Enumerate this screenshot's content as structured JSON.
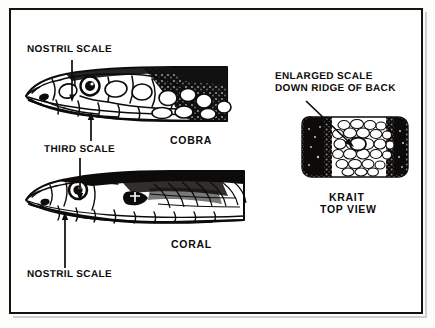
{
  "figure": {
    "type": "line-art-illustration",
    "background_color": "#ffffff",
    "ink_color": "#0d0b09",
    "frame_color": "#15120f"
  },
  "annotations": [
    {
      "id": "nostril-scale-cobra",
      "text": "NOSTRIL SCALE",
      "points_to": "cobra-nostril-scale",
      "leader": "vertical-line-down"
    },
    {
      "id": "third-scale",
      "text": "THIRD SCALE",
      "points_to": "cobra-third-scale-and-coral-third-scale",
      "leader": "arrows-up-and-down"
    },
    {
      "id": "nostril-scale-coral",
      "text": "NOSTRIL SCALE",
      "points_to": "coral-nostril-scale",
      "leader": "vertical-line-up"
    },
    {
      "id": "enlarged-scale",
      "text": "ENLARGED SCALE\nDOWN RIDGE OF BACK",
      "line1": "ENLARGED SCALE",
      "line2": "DOWN RIDGE OF BACK",
      "points_to": "krait-ridge-scale",
      "leader": "diagonal-arrow-down-right"
    }
  ],
  "specimens": [
    {
      "id": "cobra",
      "caption": "COBRA",
      "view": "side",
      "caption_lines": [
        "COBRA"
      ]
    },
    {
      "id": "coral",
      "caption": "CORAL",
      "view": "side",
      "caption_lines": [
        "CORAL"
      ]
    },
    {
      "id": "krait",
      "caption": "KRAIT\nTOP VIEW",
      "view": "top",
      "caption_lines": [
        "KRAIT",
        "TOP VIEW"
      ]
    }
  ],
  "labels": {
    "nostril_scale_top": "NOSTRIL SCALE",
    "third_scale": "THIRD SCALE",
    "nostril_scale_bottom": "NOSTRIL SCALE",
    "enlarged_scale_line1": "ENLARGED SCALE",
    "enlarged_scale_line2": "DOWN RIDGE OF BACK",
    "cobra_caption": "COBRA",
    "coral_caption": "CORAL",
    "krait_caption_line1": "KRAIT",
    "krait_caption_line2": "TOP VIEW"
  }
}
